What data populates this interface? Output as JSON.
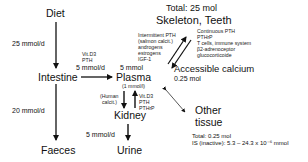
{
  "nodes": {
    "diet": "Diet",
    "intestine": "Intestine",
    "plasma": "Plasma",
    "plasma_conc": "(1 mmol/l)",
    "kidney": "Kidney",
    "faeces": "Faeces",
    "urine": "Urine",
    "skeleton": "Skeleton, Teeth",
    "skeleton_total": "Total: 25 mol",
    "accessible_calcium": "Accessible calcium",
    "accessible_amount": "0.25 mol",
    "other_tissue_line1": "Other",
    "other_tissue_line2": "tissue",
    "other_total": "Total: 0.25 mol",
    "other_is": "IS (inactive): 5.3 – 24.3 x 10⁻⁶ mmol"
  },
  "flows": {
    "diet_to_intestine": "25 mmol/d",
    "intestine_to_faeces": "20 mmol/d",
    "intestine_to_plasma": "5 mmol/d",
    "plasma_pool": "5 mmol",
    "kidney_to_urine": "5 mmol/d"
  },
  "regulators": {
    "intestine_absorption": [
      "Vit.D3",
      "PTH"
    ],
    "plasma_to_kidney": [
      "(Human",
      "calcit.)"
    ],
    "kidney_to_plasma": [
      "Vit.D3",
      "PTH",
      "PTHrP"
    ],
    "bone_formation": [
      "Intermittent PTH",
      "(salmon calcit.)",
      "androgens",
      "estrogens",
      "IGF-1"
    ],
    "bone_resorption": [
      "Continuous PTH",
      "PTHrP",
      "T cells, immune system",
      "β2-adrenoceptor",
      "glucocorticoide"
    ]
  }
}
